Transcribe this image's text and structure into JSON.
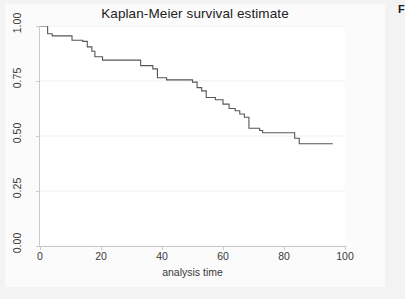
{
  "figure": {
    "title": "Kaplan-Meier survival estimate",
    "corner_mark": "F",
    "bg_color": "#f3f3f3",
    "panel_color": "#ffffff",
    "line_color": "#555555",
    "grid_color": "#efefef",
    "axis_color": "#c9c9c9"
  },
  "chart_data": {
    "type": "line",
    "title": "Kaplan-Meier survival estimate",
    "xlabel": "analysis time",
    "ylabel": "",
    "xlim": [
      0,
      100
    ],
    "ylim": [
      0,
      1.0
    ],
    "xticks": [
      0,
      20,
      40,
      60,
      80,
      100
    ],
    "xticklabels": [
      "0",
      "20",
      "40",
      "60",
      "80",
      "100"
    ],
    "yticks": [
      0.0,
      0.25,
      0.5,
      0.75,
      1.0
    ],
    "yticklabels": [
      "0.00",
      "0.25",
      "0.50",
      "0.75",
      "1.00"
    ],
    "grid": true,
    "legend": null,
    "series": [
      {
        "name": "survival",
        "step": "post",
        "x": [
          0,
          1.5,
          2.5,
          4,
          9.5,
          10.5,
          14,
          15.5,
          17,
          18,
          20.5,
          33,
          35,
          37,
          38.5,
          41.5,
          50,
          51.5,
          53,
          54.5,
          57.5,
          60,
          62,
          64,
          65.5,
          67,
          68.5,
          72,
          73,
          81,
          83.5,
          85,
          96
        ],
        "y": [
          1.0,
          1.0,
          0.965,
          0.955,
          0.955,
          0.935,
          0.93,
          0.905,
          0.885,
          0.86,
          0.845,
          0.82,
          0.82,
          0.805,
          0.765,
          0.755,
          0.745,
          0.72,
          0.705,
          0.675,
          0.665,
          0.645,
          0.625,
          0.615,
          0.6,
          0.585,
          0.535,
          0.525,
          0.515,
          0.515,
          0.49,
          0.465,
          0.465
        ]
      }
    ]
  }
}
